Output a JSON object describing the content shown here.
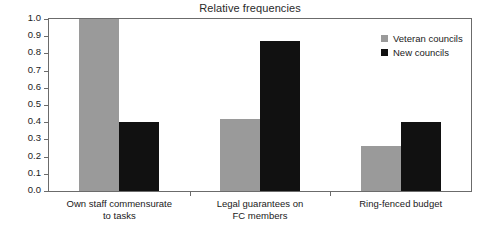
{
  "chart_data": {
    "type": "bar",
    "title": "Relative frequencies",
    "xlabel": "",
    "ylabel": "",
    "ylim": [
      0.0,
      1.0
    ],
    "grid": false,
    "legend_position": "top-right",
    "categories": [
      "Own staff commensurate to tasks",
      "Legal guarantees on FC members",
      "Ring-fenced budget"
    ],
    "category_lines": [
      [
        "Own staff commensurate",
        "to tasks"
      ],
      [
        "Legal guarantees on",
        "FC members"
      ],
      [
        "Ring-fenced budget",
        ""
      ]
    ],
    "series": [
      {
        "name": "Veteran councils",
        "color": "#9a9a9a",
        "values": [
          1.0,
          0.42,
          0.26
        ]
      },
      {
        "name": "New councils",
        "color": "#111111",
        "values": [
          0.4,
          0.87,
          0.4
        ]
      }
    ],
    "y_ticks": [
      "1.0",
      "0.9",
      "0.8",
      "0.7",
      "0.6",
      "0.5",
      "0.4",
      "0.3",
      "0.2",
      "0.1",
      "0.0"
    ],
    "y_tick_values": [
      1.0,
      0.9,
      0.8,
      0.7,
      0.6,
      0.5,
      0.4,
      0.3,
      0.2,
      0.1,
      0.0
    ]
  },
  "legend": {
    "items": [
      {
        "label": "Veteran councils"
      },
      {
        "label": "New councils"
      }
    ]
  }
}
